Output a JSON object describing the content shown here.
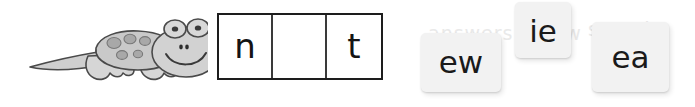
{
  "activity": {
    "type": "phonics-drag-and-drop",
    "background_color": "#ffffff"
  },
  "illustration": {
    "name": "gecko",
    "alt_label": "gecko",
    "body_color": "#c9c9c9",
    "outline_color": "#4a4a4a",
    "spot_color": "#9a9a9a"
  },
  "word_frame": {
    "border_color": "#1d1d1d",
    "cells": [
      {
        "letter": "n",
        "empty": false
      },
      {
        "letter": "",
        "empty": true
      },
      {
        "letter": "t",
        "empty": false
      }
    ]
  },
  "tiles": [
    {
      "label": "ew",
      "id": "tile-ew"
    },
    {
      "label": "ie",
      "id": "tile-ie"
    },
    {
      "label": "ea",
      "id": "tile-ea"
    }
  ],
  "ghost_text": {
    "left": "answers below",
    "right": "sound"
  }
}
